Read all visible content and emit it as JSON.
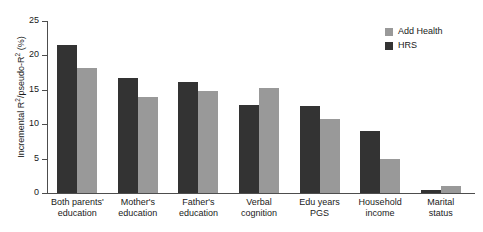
{
  "chart_data": {
    "type": "bar",
    "title": "",
    "xlabel": "",
    "ylabel": "Incremental R²/pseudo-R² (%)",
    "ylabel_main": "Incremental R",
    "ylabel_sup1": "2",
    "ylabel_mid": "/pseudo-R",
    "ylabel_sup2": "2",
    "ylabel_tail": " (%)",
    "ylim": [
      0,
      25
    ],
    "yticks": [
      0,
      5,
      10,
      15,
      20,
      25
    ],
    "ytick_labels": [
      "0",
      "5",
      "10",
      "15",
      "20",
      "25"
    ],
    "grid": false,
    "legend_position": "top-right",
    "categories": [
      "Both parents' education",
      "Mother's education",
      "Father's education",
      "Verbal cognition",
      "Edu years PGS",
      "Household income",
      "Marital status"
    ],
    "category_lines": [
      [
        "Both parents'",
        "education"
      ],
      [
        "Mother's",
        "education"
      ],
      [
        "Father's",
        "education"
      ],
      [
        "Verbal",
        "cognition"
      ],
      [
        "Edu years",
        "PGS"
      ],
      [
        "Household",
        "income"
      ],
      [
        "Marital",
        "status"
      ]
    ],
    "series": [
      {
        "name": "HRS",
        "color": "#333333",
        "values": [
          21.5,
          16.7,
          16.2,
          12.8,
          12.7,
          9.0,
          0.4
        ]
      },
      {
        "name": "Add Health",
        "color": "#999999",
        "values": [
          18.1,
          14.0,
          14.8,
          15.3,
          10.8,
          5.0,
          1.0
        ]
      }
    ]
  },
  "legend": {
    "items": [
      {
        "label": "Add Health",
        "color": "#999999"
      },
      {
        "label": "HRS",
        "color": "#333333"
      }
    ]
  },
  "colors": {
    "hrs": "#333333",
    "add_health": "#999999",
    "axis": "#4d4d4d",
    "text": "#1a1a1a",
    "background": "#ffffff"
  }
}
